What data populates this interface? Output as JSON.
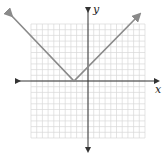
{
  "chart_data": {
    "type": "line",
    "title": "",
    "xlabel": "x",
    "ylabel": "y",
    "function": "y = |x + 2|",
    "vertex": [
      -2,
      0
    ],
    "xlim": [
      -10,
      10
    ],
    "ylim": [
      -10,
      10
    ],
    "grid": true,
    "series": [
      {
        "name": "left branch",
        "x": [
          -10,
          -2
        ],
        "y": [
          8,
          0
        ]
      },
      {
        "name": "right branch",
        "x": [
          -2,
          10
        ],
        "y": [
          0,
          12
        ]
      }
    ]
  },
  "axes": {
    "x_label": "x",
    "y_label": "y"
  },
  "colors": {
    "grid": "#d8d8d8",
    "axis": "#333333",
    "curve": "#8a8a8a"
  }
}
